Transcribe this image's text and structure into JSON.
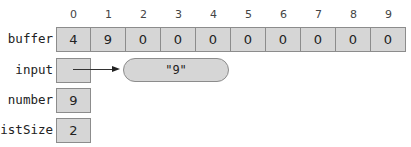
{
  "indices": [
    "0",
    "1",
    "2",
    "3",
    "4",
    "5",
    "6",
    "7",
    "8",
    "9"
  ],
  "variables": {
    "buffer": {
      "label": "buffer",
      "values": [
        "4",
        "9",
        "0",
        "0",
        "0",
        "0",
        "0",
        "0",
        "0",
        "0"
      ]
    },
    "input": {
      "label": "input",
      "value": "",
      "points_to": "\"9\""
    },
    "number": {
      "label": "number",
      "value": "9"
    },
    "listSize": {
      "label": "listSize",
      "value": "2"
    }
  }
}
